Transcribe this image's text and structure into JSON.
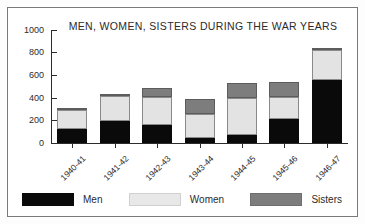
{
  "chart_data": {
    "type": "bar",
    "subtype": "stacked-bar",
    "title": "MEN, WOMEN, SISTERS DURING THE WAR YEARS",
    "xlabel": "",
    "ylabel": "",
    "ylim": [
      0,
      1000
    ],
    "yticks": [
      0,
      200,
      400,
      600,
      800,
      1000
    ],
    "ytick_labels": [
      "0",
      "200",
      "400",
      "600",
      "800",
      "1000"
    ],
    "grid": false,
    "legend_position": "bottom",
    "categories": [
      "1940-41",
      "1941-42",
      "1942-43",
      "1943-44",
      "1944-45",
      "1945-46",
      "1946-47"
    ],
    "series": [
      {
        "name": "Men",
        "color": "#0a0a0a",
        "values": [
          125,
          195,
          160,
          45,
          75,
          210,
          555
        ]
      },
      {
        "name": "Women",
        "color": "#e3e3e3",
        "values": [
          170,
          225,
          245,
          215,
          320,
          200,
          265
        ]
      },
      {
        "name": "Sisters",
        "color": "#7d7d7d",
        "values": [
          5,
          10,
          80,
          130,
          140,
          130,
          25
        ]
      }
    ],
    "totals": [
      300,
      430,
      485,
      390,
      535,
      540,
      845
    ]
  },
  "title": {
    "text": "MEN, WOMEN, SISTERS DURING THE WAR YEARS"
  },
  "axis": {
    "y_labels": [
      "1000",
      "800",
      "600",
      "400",
      "200",
      "0"
    ],
    "x_labels": [
      "1940-41",
      "1941-42",
      "1942-43",
      "1943-44",
      "1944-45",
      "1945-46",
      "1946-47"
    ]
  },
  "legend": {
    "items": [
      {
        "label": "Men"
      },
      {
        "label": "Women"
      },
      {
        "label": "Sisters"
      }
    ]
  }
}
